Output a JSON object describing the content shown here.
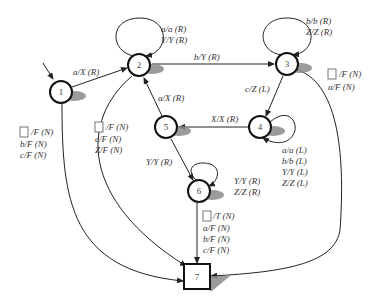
{
  "diagram": {
    "type": "turing-machine-state-diagram",
    "states": [
      {
        "id": "1",
        "label": "1",
        "kind": "start"
      },
      {
        "id": "2",
        "label": "2",
        "kind": "normal"
      },
      {
        "id": "3",
        "label": "3",
        "kind": "normal"
      },
      {
        "id": "4",
        "label": "4",
        "kind": "normal"
      },
      {
        "id": "5",
        "label": "5",
        "kind": "normal"
      },
      {
        "id": "6",
        "label": "6",
        "kind": "normal"
      },
      {
        "id": "7",
        "label": "7",
        "kind": "halt"
      }
    ],
    "transitions": [
      {
        "from": "1",
        "to": "2",
        "labels": [
          "a/X (R)"
        ]
      },
      {
        "from": "2",
        "to": "2",
        "labels": [
          "a/a (R)",
          "Y/Y (R)"
        ]
      },
      {
        "from": "2",
        "to": "3",
        "labels": [
          "b/Y (R)"
        ]
      },
      {
        "from": "3",
        "to": "3",
        "labels": [
          "b/b (R)",
          "Z/Z (R)"
        ]
      },
      {
        "from": "3",
        "to": "4",
        "labels": [
          "c/Z (L)"
        ]
      },
      {
        "from": "4",
        "to": "4",
        "labels": [
          "a/a (L)",
          "b/b (L)",
          "Y/Y (L)",
          "Z/Z (L)"
        ]
      },
      {
        "from": "4",
        "to": "5",
        "labels": [
          "X/X (R)"
        ]
      },
      {
        "from": "5",
        "to": "2",
        "labels": [
          "a/X (R)"
        ]
      },
      {
        "from": "5",
        "to": "6",
        "labels": [
          "Y/Y (R)"
        ]
      },
      {
        "from": "6",
        "to": "6",
        "labels": [
          "Y/Y (R)",
          "Z/Z (R)"
        ]
      },
      {
        "from": "6",
        "to": "7",
        "labels": [
          "□/T (N)",
          "a/F (N)",
          "b/F (N)",
          "c/F (N)"
        ]
      },
      {
        "from": "1",
        "to": "7",
        "labels": [
          "□/F (N)",
          "b/F (N)",
          "c/F (N)"
        ]
      },
      {
        "from": "2",
        "to": "7",
        "labels": [
          "□/F (N)",
          "c/F (N)",
          "Z/F (N)"
        ]
      },
      {
        "from": "3",
        "to": "7",
        "labels": [
          "□/F (N)",
          "a/F (N)"
        ]
      }
    ],
    "text": {
      "t12": "a/X (R)",
      "t22a": "a/a (R)",
      "t22b": "Y/Y (R)",
      "t23": "b/Y (R)",
      "t33a": "b/b (R)",
      "t33b": "Z/Z (R)",
      "t34": "c/Z (L)",
      "t44a": "a/a (L)",
      "t44b": "b/b (L)",
      "t44c": "Y/Y (L)",
      "t44d": "Z/Z (L)",
      "t45": "X/X (R)",
      "t52": "a/X (R)",
      "t56": "Y/Y (R)",
      "t66a": "Y/Y (R)",
      "t66b": "Z/Z (R)",
      "t67a": "/T (N)",
      "t67b": "a/F (N)",
      "t67c": "b/F (N)",
      "t67d": "c/F (N)",
      "t17a": "/F (N)",
      "t17b": "b/F (N)",
      "t17c": "c/F (N)",
      "t27a": "/F (N)",
      "t27b": "c/F (N)",
      "t27c": "Z/F (N)",
      "t37a": "/F (N)",
      "t37b": "a/F (N)"
    },
    "blank_symbol": "empty-square"
  }
}
